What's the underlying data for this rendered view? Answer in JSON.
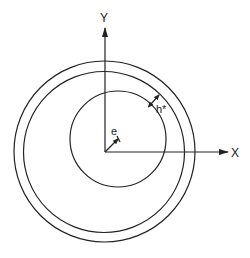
{
  "diagram": {
    "axes": {
      "x_label": "X",
      "y_label": "Y"
    },
    "labels": {
      "eccentricity": "e",
      "film_thickness": "h*"
    },
    "elements": [
      {
        "name": "outer-circle",
        "description": "bearing outer boundary"
      },
      {
        "name": "middle-circle",
        "description": "bearing inner surface"
      },
      {
        "name": "inner-circle",
        "description": "journal (eccentric shaft)"
      },
      {
        "name": "eccentricity-vector",
        "description": "offset from origin to journal center"
      },
      {
        "name": "film-thickness-marker",
        "description": "minimum clearance between journal and bearing"
      }
    ],
    "colors": {
      "ink": "#222222",
      "background": "#ffffff"
    }
  }
}
